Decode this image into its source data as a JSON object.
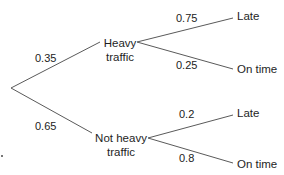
{
  "diagram": {
    "type": "probability-tree",
    "root": {
      "branches": [
        {
          "probability": "0.35",
          "node": {
            "label_line1": "Heavy",
            "label_line2": "traffic",
            "branches": [
              {
                "probability": "0.75",
                "outcome": "Late"
              },
              {
                "probability": "0.25",
                "outcome": "On time"
              }
            ]
          }
        },
        {
          "probability": "0.65",
          "node": {
            "label_line1": "Not heavy",
            "label_line2": "traffic",
            "branches": [
              {
                "probability": "0.2",
                "outcome": "Late"
              },
              {
                "probability": "0.8",
                "outcome": "On time"
              }
            ]
          }
        }
      ]
    },
    "colors": {
      "line": "#5a5a5a",
      "text": "#222222",
      "background": "#ffffff"
    }
  }
}
